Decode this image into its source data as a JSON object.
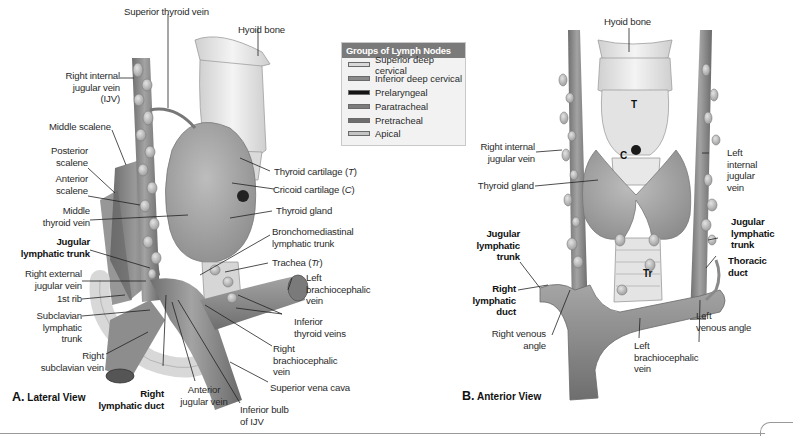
{
  "figure": {
    "panel_a": {
      "title_letter": "A.",
      "title_text": "Lateral View",
      "labels": {
        "superior_thyroid_vein": "Superior thyroid vein",
        "hyoid_bone": "Hyoid bone",
        "right_internal_jugular_vein": "Right internal\njugular vein\n(IJV)",
        "middle_scalene": "Middle scalene",
        "posterior_scalene": "Posterior\nscalene",
        "anterior_scalene": "Anterior\nscalene",
        "middle_thyroid_vein": "Middle\nthyroid vein",
        "jugular_lymphatic_trunk": "Jugular\nlymphatic trunk",
        "right_external_jugular_vein": "Right external\njugular vein",
        "first_rib": "1st rib",
        "subclavian_lymphatic_trunk": "Subclavian\nlymphatic\ntrunk",
        "right_subclavian_vein": "Right\nsubclavian vein",
        "right_lymphatic_duct": "Right\nlymphatic duct",
        "anterior_jugular_vein": "Anterior\njugular vein",
        "inferior_bulb_ijv": "Inferior bulb\nof IJV",
        "superior_vena_cava": "Superior vena cava",
        "right_brachiocephalic_vein": "Right\nbrachiocephalic\nvein",
        "inferior_thyroid_veins": "Inferior\nthyroid veins",
        "left_brachiocephalic_vein": "Left\nbrachiocephalic\nvein",
        "trachea": "Trachea (",
        "trachea_abbr": "Tr",
        "trachea_close": ")",
        "bronchomediastinal_trunk": "Bronchomediastinal\nlymphatic trunk",
        "thyroid_gland": "Thyroid gland",
        "cricoid_cartilage": "Cricoid cartilage (",
        "cricoid_abbr": "C",
        "cricoid_close": ")",
        "thyroid_cartilage": "Thyroid cartilage (",
        "thyroid_abbr": "T",
        "thyroid_close": ")"
      }
    },
    "panel_b": {
      "title_letter": "B.",
      "title_text": "Anterior View",
      "markers": {
        "thyroid_cartilage": "T",
        "cricoid_cartilage": "C",
        "trachea": "Tr"
      },
      "labels": {
        "hyoid_bone": "Hyoid bone",
        "right_internal_jugular_vein": "Right internal\njugular vein",
        "thyroid_gland": "Thyroid gland",
        "jugular_lymphatic_trunk_right": "Jugular\nlymphatic\ntrunk",
        "right_lymphatic_duct": "Right\nlymphatic\nduct",
        "right_venous_angle": "Right venous\nangle",
        "left_brachiocephalic_vein": "Left\nbrachiocephalic\nvein",
        "left_venous_angle": "Left\nvenous angle",
        "thoracic_duct": "Thoracic\nduct",
        "jugular_lymphatic_trunk_left": "Jugular\nlymphatic\ntrunk",
        "left_internal_jugular_vein": "Left\ninternal\njugular\nvein"
      }
    },
    "legend": {
      "title": "Groups of Lymph Nodes",
      "items": [
        {
          "label": "Superior deep cervical",
          "color": "#d9d9d9"
        },
        {
          "label": "Inferior deep cervical",
          "color": "#8a8a8a"
        },
        {
          "label": "Prelaryngeal",
          "color": "#141414"
        },
        {
          "label": "Paratracheal",
          "color": "#7c7c7c"
        },
        {
          "label": "Pretracheal",
          "color": "#6e6e6e"
        },
        {
          "label": "Apical",
          "color": "#c4c4c4"
        }
      ]
    },
    "colors": {
      "vein": "#8f8f8f",
      "vein_dark": "#6a6a6a",
      "cartilage": "#e6e6e6",
      "thyroid": "#a9a9a9",
      "muscle": "#7d7d7d",
      "node": "#bdbdbd",
      "leader": "#222222"
    }
  }
}
